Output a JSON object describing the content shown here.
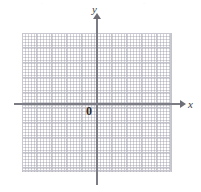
{
  "figure": {
    "type": "coordinate-plane",
    "background_color": "#ffffff"
  },
  "axes": {
    "x_label": "x",
    "y_label": "y",
    "origin_label": "0",
    "axis_color": "#7c7c84",
    "x_axis_direction": "right",
    "y_axis_direction": "up"
  },
  "grid": {
    "minor_dot_color": "#b9b9c2",
    "major_line_color": "#c4c4cc",
    "border_color": "#c8c8d0",
    "minor_spacing_px": 3,
    "major_spacing_px": 15,
    "columns": 10,
    "rows": 9
  },
  "artifacts": {
    "left_mark": "·",
    "right_mark": "·"
  },
  "chart_data": {
    "type": "scatter",
    "title": "",
    "subtitle": "",
    "xlabel": "x",
    "ylabel": "y",
    "origin_label": "0",
    "xlim": [
      -5,
      5
    ],
    "ylim": [
      -4.5,
      4.5
    ],
    "xticks": [
      -5,
      -4,
      -3,
      -2,
      -1,
      0,
      1,
      2,
      3,
      4,
      5
    ],
    "yticks": [
      -4,
      -3,
      -2,
      -1,
      0,
      1,
      2,
      3,
      4
    ],
    "xtick_labels": [],
    "ytick_labels": [],
    "grid": true,
    "grid_style": "dotted-with-major-lines",
    "legend": null,
    "legend_position": null,
    "series": [],
    "annotations": []
  }
}
